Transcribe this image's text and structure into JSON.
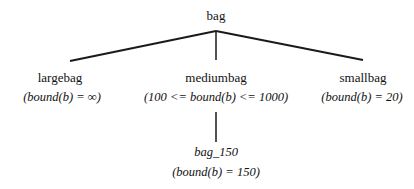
{
  "diagram": {
    "type": "tree",
    "root": {
      "name": "bag"
    },
    "children": [
      {
        "name": "largebag",
        "condition": "(bound(b) =  ∞)"
      },
      {
        "name": "mediumbag",
        "condition": "(100 <= bound(b) <= 1000)",
        "children": [
          {
            "name": "bag_150",
            "condition": "(bound(b) = 150)"
          }
        ]
      },
      {
        "name": "smallbag",
        "condition": "(bound(b) = 20)"
      }
    ],
    "line_color": "#1a1a1a"
  }
}
